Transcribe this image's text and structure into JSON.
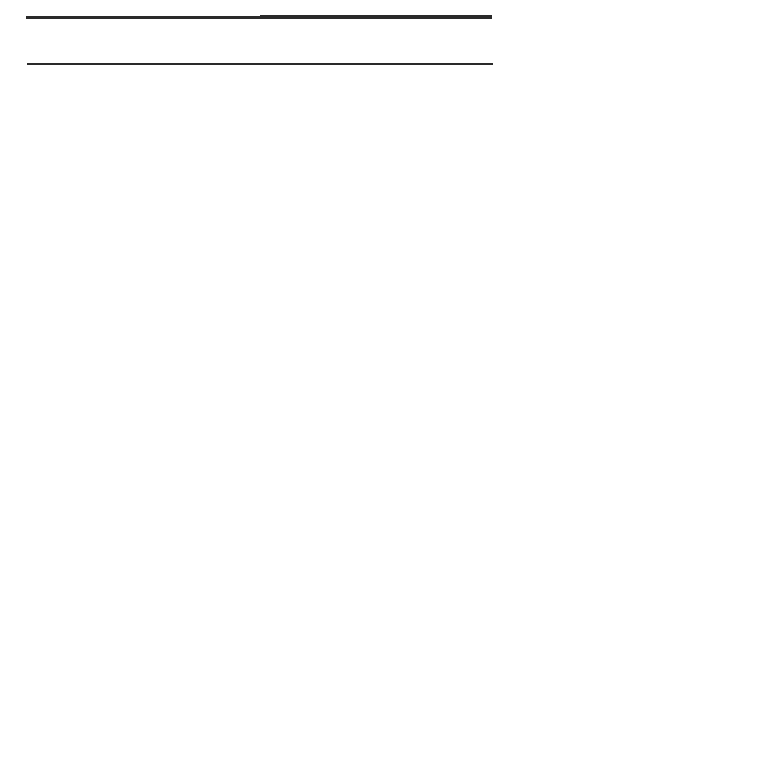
{
  "table": {
    "headers": [
      "Phase r.",
      "Phase s."
    ],
    "phase_r": {
      "mnemic_label": "mnemic excitation-complex",
      "mnemic_symbol": "r (mn)",
      "rho_label": "ρⁿ (or)",
      "plastic_label": "plastic reactions :",
      "morph_label": "morphological state r (z)",
      "original_label": "original excitation-complex",
      "original_symbol": "r (or)",
      "homophony_line1": "homophony between r (mn)",
      "homophony_line2": "and r (or)"
    },
    "phase_s": {
      "paragraph_lines": [
        "r (or) + r (mn) are not capable",
        "by themselves to ecphorise",
        "in this special case the com-",
        "plete engram-complex s (engr)",
        "along the path of the succes-",
        "sive association.   The ec-",
        "phory of a certain fraction,",
        "that is, ρⁿ (engr) of this",
        "complex, requires the as-",
        "sistance of an original ex-",
        "citation ρⁿ (or), generated",
        "by an external stimulus.",
        "Then r (or) + r (mn) + ρⁿ (or)",
        "together exphorise s (engr),",
        "originating the mnemic ex-",
        "citation-complex s (mn)"
      ],
      "plastic_label": "plastic reactions :",
      "morph_label": "morphological state s (z)",
      "original_label": "original excitation-complex",
      "original_symbol": "s (or)",
      "homophony_line1": "[homophony between s(mn) and",
      "homophony_line2": "s (or)]"
    }
  }
}
